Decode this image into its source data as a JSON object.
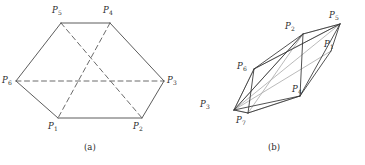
{
  "figure": {
    "background_color": "#ffffff",
    "stroke_solid_color": "#4a4a4a",
    "stroke_dashed_color": "#5a5a5a",
    "stroke_light_color": "#a8a8a8",
    "stroke_dark_color": "#333333",
    "label_color": "#2b2b2b"
  },
  "panel_a": {
    "caption": "(a)",
    "description": "hexahedral wireframe with hidden dashed edges",
    "labels": [
      {
        "name": "P",
        "sub": "5",
        "x": 52,
        "y": 6,
        "anchor": "P5"
      },
      {
        "name": "P",
        "sub": "4",
        "x": 103,
        "y": 6,
        "anchor": "P4"
      },
      {
        "name": "P",
        "sub": "6",
        "x": 2,
        "y": 76,
        "anchor": "P6"
      },
      {
        "name": "P",
        "sub": "3",
        "x": 167,
        "y": 76,
        "anchor": "P3"
      },
      {
        "name": "P",
        "sub": "1",
        "x": 48,
        "y": 122,
        "anchor": "P1"
      },
      {
        "name": "P",
        "sub": "2",
        "x": 133,
        "y": 122,
        "anchor": "P2"
      }
    ],
    "vertices": {
      "P5": [
        61,
        23
      ],
      "P4": [
        110,
        23
      ],
      "P6": [
        16,
        81
      ],
      "P3": [
        164,
        81
      ],
      "P1": [
        58,
        118
      ],
      "P2": [
        142,
        118
      ]
    },
    "solid_edges": [
      [
        "P5",
        "P4"
      ],
      [
        "P5",
        "P6"
      ],
      [
        "P4",
        "P3"
      ],
      [
        "P6",
        "P1"
      ],
      [
        "P3",
        "P2"
      ],
      [
        "P1",
        "P2"
      ]
    ],
    "dashed_edges": [
      [
        "P6",
        "P3"
      ],
      [
        "P5",
        "P2"
      ],
      [
        "P4",
        "P1"
      ]
    ]
  },
  "panel_b": {
    "caption": "(b)",
    "description": "skewed degenerate polyhedron, overlapping edge sets",
    "labels": [
      {
        "name": "P",
        "sub": "5",
        "x": 147,
        "y": 11,
        "anchor": "P5"
      },
      {
        "name": "P",
        "sub": "2",
        "x": 103,
        "y": 22,
        "anchor": "P2"
      },
      {
        "name": "P",
        "sub": "1",
        "x": 142,
        "y": 40,
        "anchor": "P1"
      },
      {
        "name": "P",
        "sub": "6",
        "x": 55,
        "y": 62,
        "anchor": "P6"
      },
      {
        "name": "P",
        "sub": "4",
        "x": 110,
        "y": 85,
        "anchor": "P4"
      },
      {
        "name": "P",
        "sub": "3",
        "x": 18,
        "y": 100,
        "anchor": "P3"
      },
      {
        "name": "P",
        "sub": "7",
        "x": 54,
        "y": 116,
        "anchor": "P7"
      }
    ],
    "vertices": {
      "P5": [
        158,
        24
      ],
      "P2": [
        121,
        34
      ],
      "P1": [
        149,
        51
      ],
      "P6": [
        72,
        69
      ],
      "P4": [
        118,
        96
      ],
      "P3": [
        52,
        110
      ],
      "P7": [
        66,
        113
      ]
    },
    "dark_edges": [
      [
        "P5",
        "P2"
      ],
      [
        "P5",
        "P1"
      ],
      [
        "P5",
        "P4"
      ],
      [
        "P5",
        "P6"
      ],
      [
        "P2",
        "P6"
      ],
      [
        "P2",
        "P3"
      ],
      [
        "P2",
        "P4"
      ],
      [
        "P1",
        "P4"
      ],
      [
        "P6",
        "P3"
      ],
      [
        "P6",
        "P7"
      ],
      [
        "P4",
        "P3"
      ],
      [
        "P4",
        "P7"
      ],
      [
        "P3",
        "P7"
      ]
    ],
    "light_edges": [
      [
        "P5",
        "P2"
      ],
      [
        "P5",
        "P6"
      ],
      [
        "P5",
        "P3"
      ],
      [
        "P2",
        "P3"
      ],
      [
        "P2",
        "P7"
      ],
      [
        "P6",
        "P3"
      ],
      [
        "P1",
        "P3"
      ],
      [
        "P4",
        "P7"
      ],
      [
        "P3",
        "P7"
      ]
    ]
  }
}
